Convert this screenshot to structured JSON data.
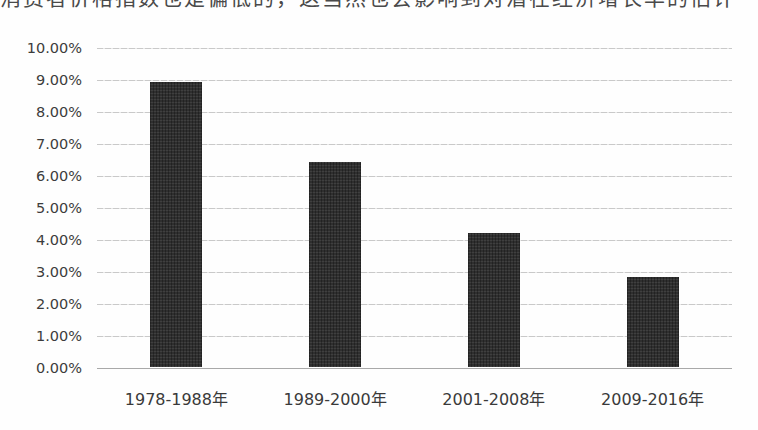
{
  "caption": {
    "text": "消费者价格指数也是偏低的，这当然也会影响到对潜在经济增长率的估计"
  },
  "chart_data": {
    "type": "bar",
    "title": "",
    "xlabel": "",
    "ylabel": "",
    "categories": [
      "1978-1988年",
      "1989-2000年",
      "2001-2008年",
      "2009-2016年"
    ],
    "values": [
      8.9,
      6.4,
      4.2,
      2.8
    ],
    "unit": "%",
    "ylim": [
      0,
      10
    ],
    "y_tick_step": 1,
    "y_ticks": [
      "10.00%",
      "9.00%",
      "8.00%",
      "7.00%",
      "6.00%",
      "5.00%",
      "4.00%",
      "3.00%",
      "2.00%",
      "1.00%",
      "0.00%"
    ],
    "grid": true,
    "legend_position": "none",
    "bar_color": "#2f2f2f",
    "gridline_color": "#c9c9c9",
    "axis_line_color": "#a9a9a9",
    "background_color": "#fefefe"
  }
}
